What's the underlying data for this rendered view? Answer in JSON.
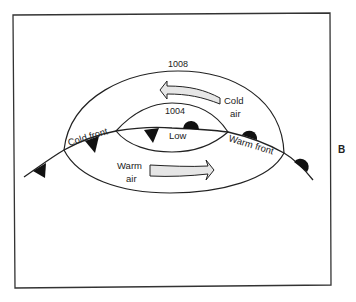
{
  "diagram": {
    "type": "weather-frontal-depression",
    "isobars": [
      {
        "label": "1008"
      },
      {
        "label": "1004"
      }
    ],
    "center_label": "Low",
    "fronts": {
      "cold": "Cold front",
      "warm": "Warm front"
    },
    "air_masses": {
      "cold_line1": "Cold",
      "cold_line2": "air",
      "warm_line1": "Warm",
      "warm_line2": "air"
    },
    "side_label": "B",
    "colors": {
      "line": "#222222",
      "arrow_fill": "#e6e6e6",
      "background": "#ffffff"
    }
  }
}
